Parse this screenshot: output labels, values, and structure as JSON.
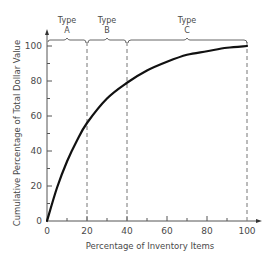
{
  "chart_data": {
    "type": "line",
    "title": "",
    "xlabel": "Percentage of Inventory Items",
    "ylabel": "Cumulative Percentage of Total Dollar Value",
    "xlim": [
      0,
      100
    ],
    "ylim": [
      0,
      100
    ],
    "x_ticks": [
      "0",
      "20",
      "40",
      "60",
      "80",
      "100"
    ],
    "y_ticks": [
      "0",
      "20",
      "40",
      "60",
      "80",
      "100"
    ],
    "grid": false,
    "series": [
      {
        "name": "ABC curve",
        "x": [
          0,
          5,
          10,
          15,
          20,
          30,
          40,
          50,
          60,
          70,
          80,
          90,
          100
        ],
        "y": [
          0,
          19,
          34,
          46,
          56,
          70,
          79,
          86,
          91,
          95,
          97,
          99,
          100
        ]
      }
    ],
    "regions": [
      {
        "label_line1": "Type",
        "label_line2": "A",
        "x_start": 0,
        "x_end": 20
      },
      {
        "label_line1": "Type",
        "label_line2": "B",
        "x_start": 20,
        "x_end": 40
      },
      {
        "label_line1": "Type",
        "label_line2": "C",
        "x_start": 40,
        "x_end": 100
      }
    ],
    "colors": {
      "curve": "#111111",
      "axis": "#555555",
      "dashed": "#777777",
      "text": "#4a4a4a"
    }
  }
}
